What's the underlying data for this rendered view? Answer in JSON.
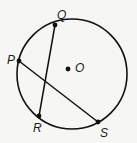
{
  "diagram": {
    "type": "circle-with-chords",
    "circle": {
      "center_label": "O",
      "cx": 72,
      "cy": 74,
      "r": 55
    },
    "points": [
      {
        "label": "Q",
        "x": 55,
        "y": 25
      },
      {
        "label": "P",
        "x": 19,
        "y": 61
      },
      {
        "label": "R",
        "x": 39,
        "y": 116
      },
      {
        "label": "S",
        "x": 98,
        "y": 122
      },
      {
        "label": "O",
        "x": 68,
        "y": 69
      }
    ],
    "chords": [
      {
        "from": "Q",
        "to": "R"
      },
      {
        "from": "P",
        "to": "S"
      }
    ],
    "labels": {
      "Q": "Q",
      "P": "P",
      "R": "R",
      "S": "S",
      "O": "O"
    },
    "stroke_color": "#111111"
  }
}
